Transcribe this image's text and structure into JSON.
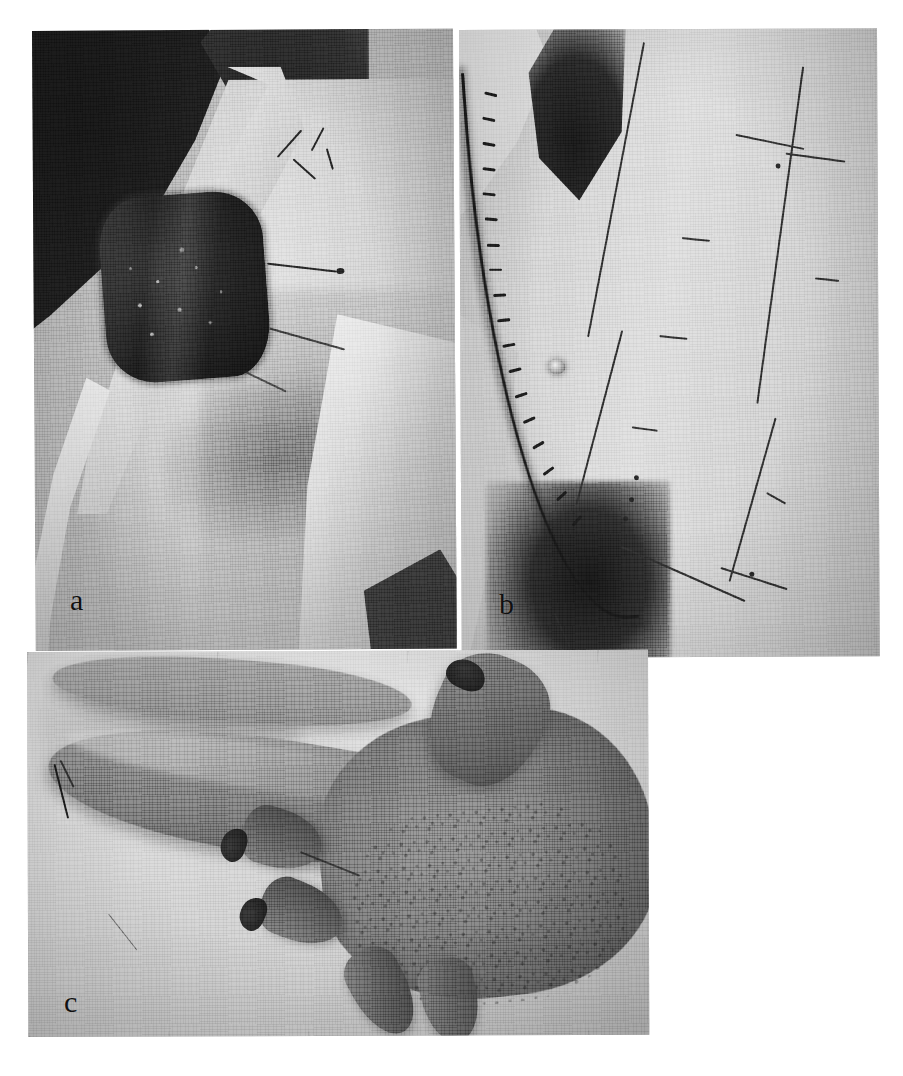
{
  "figure": {
    "kind": "photographic-plate",
    "medium": "black-and-white halftone photograph",
    "panel_count": 3,
    "background_color": "#ffffff"
  },
  "panels": [
    {
      "id": "a",
      "label": "a",
      "label_position": {
        "x": 75,
        "y": 598
      },
      "bounds": {
        "x": 32,
        "y": 31,
        "width": 421,
        "height": 620
      },
      "subject": "shoulder-defect",
      "description": "Operative photograph of a shoulder and upper arm with a large dark square full-thickness defect over the deltoid region, surrounded by sterile white drapes against a dark background. Fine silk traction sutures extend from the wound margins.",
      "features": [
        "dark operating-room background upper left",
        "white sterile drape sweeping diagonally",
        "square granulating excision defect",
        "silk traction sutures",
        "axillary fold shadow"
      ]
    },
    {
      "id": "b",
      "label": "b",
      "label_position": {
        "x": 504,
        "y": 602
      },
      "bounds": {
        "x": 459,
        "y": 30,
        "width": 418,
        "height": 628
      },
      "subject": "abdomen-donor-site",
      "description": "Lower abdomen and groin showing a long curved sutured incision with interrupted stitches along the left side, the umbilicus at centre, and an inked surgical plan of a rectangular tubed pedicle flap drawn on the skin with tick marks and ink dots.",
      "features": [
        "curved sutured incision with interrupted stitches",
        "umbilicus",
        "ink-drawn rectangular flap outline",
        "ink cross tick marks",
        "ink reference dots",
        "white drape upper left",
        "groin shadow lower left"
      ]
    },
    {
      "id": "c",
      "label": "c",
      "label_position": {
        "x": 69,
        "y": 1000
      },
      "bounds": {
        "x": 27,
        "y": 652,
        "width": 621,
        "height": 385
      },
      "subject": "hand-with-tubed-pedicle",
      "description": "Dorsum of a hand lying on white sheets with a tubed pedicle flap attached and running diagonally across the fingers toward the wrist; fingers are flexed beneath the tube and a fine suture line crosses the proximal pedicle.",
      "features": [
        "tubed pedicle flap crossing the hand",
        "flexed fingers with dark nails",
        "thumb raised upper right",
        "suture line at proximal pedicle",
        "white draw sheet folds"
      ]
    }
  ],
  "labels": {
    "a": "a",
    "b": "b",
    "c": "c"
  }
}
